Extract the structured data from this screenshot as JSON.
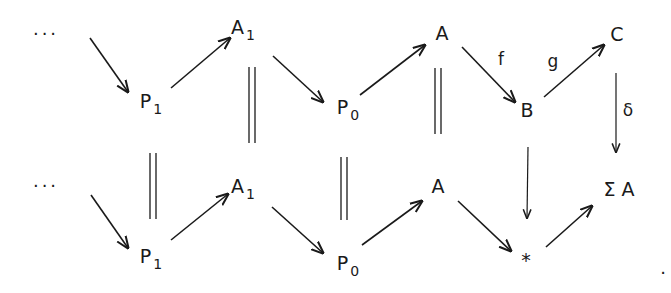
{
  "diagram": {
    "type": "commutative-diagram",
    "top_row": {
      "ellipsis": "···",
      "nodes": [
        {
          "id": "P1_top",
          "base": "P",
          "sub": "1"
        },
        {
          "id": "A1_top",
          "base": "A",
          "sub": "1"
        },
        {
          "id": "P0_top",
          "base": "P",
          "sub": "0"
        },
        {
          "id": "A_top",
          "base": "A",
          "sub": ""
        },
        {
          "id": "B",
          "base": "B",
          "sub": ""
        },
        {
          "id": "C",
          "base": "C",
          "sub": ""
        }
      ]
    },
    "bottom_row": {
      "ellipsis": "···",
      "nodes": [
        {
          "id": "P1_bot",
          "base": "P",
          "sub": "1"
        },
        {
          "id": "A1_bot",
          "base": "A",
          "sub": "1"
        },
        {
          "id": "P0_bot",
          "base": "P",
          "sub": "0"
        },
        {
          "id": "A_bot",
          "base": "A",
          "sub": ""
        },
        {
          "id": "star",
          "base": "*",
          "sub": ""
        },
        {
          "id": "SigmaA",
          "base": "Σ A",
          "sub": ""
        }
      ]
    },
    "arrow_labels": {
      "f": "f",
      "g": "g",
      "delta": "δ"
    },
    "edges": [
      {
        "from": "…",
        "to": "P1_top",
        "kind": "arrow"
      },
      {
        "from": "P1_top",
        "to": "A1_top",
        "kind": "arrow"
      },
      {
        "from": "A1_top",
        "to": "P0_top",
        "kind": "arrow"
      },
      {
        "from": "P0_top",
        "to": "A_top",
        "kind": "arrow"
      },
      {
        "from": "A_top",
        "to": "B",
        "kind": "arrow",
        "label": "f"
      },
      {
        "from": "B",
        "to": "C",
        "kind": "arrow",
        "label": "g"
      },
      {
        "from": "C",
        "to": "SigmaA",
        "kind": "arrow",
        "label": "δ"
      },
      {
        "from": "B",
        "to": "star",
        "kind": "arrow"
      },
      {
        "from": "…",
        "to": "P1_bot",
        "kind": "arrow"
      },
      {
        "from": "P1_bot",
        "to": "A1_bot",
        "kind": "arrow"
      },
      {
        "from": "A1_bot",
        "to": "P0_bot",
        "kind": "arrow"
      },
      {
        "from": "P0_bot",
        "to": "A_bot",
        "kind": "arrow"
      },
      {
        "from": "A_bot",
        "to": "star",
        "kind": "arrow"
      },
      {
        "from": "star",
        "to": "SigmaA",
        "kind": "arrow"
      },
      {
        "from": "P1_top",
        "to": "P1_bot",
        "kind": "equality"
      },
      {
        "from": "A1_top",
        "to": "A1_bot",
        "kind": "equality"
      },
      {
        "from": "P0_top",
        "to": "P0_bot",
        "kind": "equality"
      },
      {
        "from": "A_top",
        "to": "A_bot",
        "kind": "equality"
      }
    ],
    "terminal_punctuation": ".",
    "colors": {
      "ink": "#1a1a1a",
      "background": "#ffffff"
    }
  }
}
